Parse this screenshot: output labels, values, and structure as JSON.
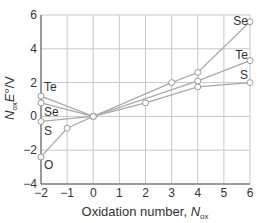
{
  "chart_data": {
    "type": "line",
    "title": "",
    "xlabel": "Oxidation number, N_ox",
    "xlabel_main": "Oxidation number, ",
    "xlabel_var": "N",
    "xlabel_sub": "ox",
    "ylabel": "N_ox E°/V",
    "ylabel_var": "N",
    "ylabel_sub": "ox",
    "ylabel_rest": "E",
    "ylabel_unit": "°/V",
    "xlim": [
      -2,
      6
    ],
    "ylim": [
      -4,
      6
    ],
    "xticks": [
      -2,
      -1,
      0,
      1,
      2,
      3,
      4,
      5,
      6
    ],
    "xtick_labels": [
      "−2",
      "−1",
      "0",
      "1",
      "2",
      "3",
      "4",
      "5",
      "6"
    ],
    "yticks": [
      -4,
      -2,
      0,
      2,
      4,
      6
    ],
    "ytick_labels": [
      "−4",
      "−2",
      "0",
      "2",
      "4",
      "6"
    ],
    "grid": true,
    "legend": "inline labels",
    "series": [
      {
        "name": "O",
        "x": [
          -2,
          -1,
          0
        ],
        "y": [
          -2.4,
          -0.7,
          0
        ],
        "label_pos": "left-bottom"
      },
      {
        "name": "S",
        "x": [
          -2,
          0,
          2,
          4,
          6
        ],
        "y": [
          -0.3,
          0,
          0.8,
          1.75,
          2.0
        ],
        "label_pos": "left-below / right"
      },
      {
        "name": "Se",
        "x": [
          -2,
          0,
          3,
          4,
          6
        ],
        "y": [
          0.8,
          0,
          2.0,
          2.6,
          5.6
        ],
        "label_pos": "left / right-top"
      },
      {
        "name": "Te",
        "x": [
          -2,
          0,
          4,
          6
        ],
        "y": [
          1.2,
          0,
          2.1,
          3.3
        ],
        "label_pos": "left-top / right"
      }
    ],
    "colors": {
      "line": "#a8a8a8",
      "grid": "#c8c8c8",
      "axis": "#555555",
      "text": "#333333",
      "marker_fill": "#ffffff",
      "marker_stroke": "#999999"
    }
  }
}
